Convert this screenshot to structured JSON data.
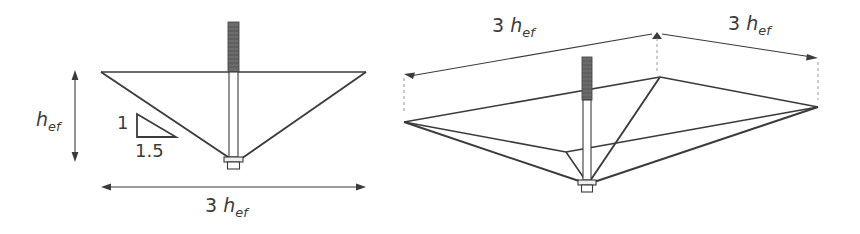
{
  "figure": {
    "stroke_color": "#3b3b3b",
    "bolt_thread_color": "#6b6b6b",
    "bolt_shank_color": "#ffffff",
    "background": "#ffffff"
  },
  "views": {
    "elevation": {
      "name": "side-elevation-view",
      "labels": {
        "height": {
          "prefix": "",
          "symbol": "h",
          "subscript": "ef"
        },
        "width": {
          "prefix": "3",
          "symbol": "h",
          "subscript": "ef"
        },
        "slope_vertical": "1",
        "slope_horizontal": "1.5"
      }
    },
    "isometric": {
      "name": "isometric-3d-view",
      "labels": {
        "dim_left": {
          "prefix": "3",
          "symbol": "h",
          "subscript": "ef"
        },
        "dim_right": {
          "prefix": "3",
          "symbol": "h",
          "subscript": "ef"
        }
      }
    }
  },
  "text": {
    "hef": "h",
    "hef_sub": "ef",
    "three": "3",
    "slope_rise": "1",
    "slope_run": "1.5"
  }
}
